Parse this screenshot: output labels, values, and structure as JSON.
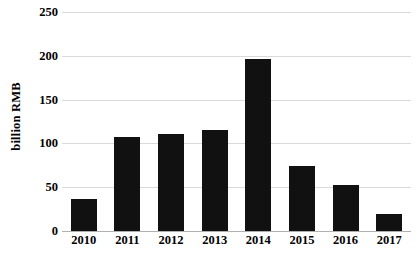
{
  "chart_data": {
    "type": "bar",
    "title": "",
    "subtitle": "",
    "xlabel": "",
    "ylabel": "billion RMB",
    "categories": [
      "2010",
      "2011",
      "2012",
      "2013",
      "2014",
      "2015",
      "2016",
      "2017"
    ],
    "values": [
      36,
      107,
      111,
      115,
      196,
      74,
      52,
      19
    ],
    "series": [
      {
        "name": "billion RMB",
        "values": [
          36,
          107,
          111,
          115,
          196,
          74,
          52,
          19
        ]
      }
    ],
    "ylim": [
      0,
      250
    ],
    "yticks": [
      0,
      50,
      100,
      150,
      200,
      250
    ],
    "ytick_labels": [
      "0",
      "50",
      "100",
      "150",
      "200",
      "250"
    ],
    "grid": true,
    "grid_axis": "y",
    "legend": false,
    "legend_position": "none",
    "bar_color": "#111111",
    "gridline_color": "#d9d9d9",
    "axis_color": "#b0b0b0",
    "background_color": "#ffffff",
    "text_color": "#000000"
  }
}
